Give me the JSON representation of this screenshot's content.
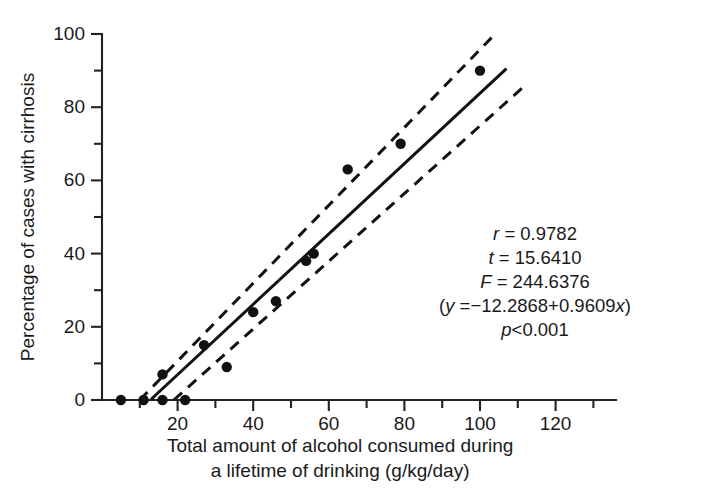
{
  "chart_data": {
    "type": "scatter",
    "title": "",
    "xlabel": "Total amount of alcohol consumed during a lifetime of drinking (g/kg/day)",
    "xlabel_line1": "Total amount of alcohol consumed during",
    "xlabel_line2": "a lifetime of drinking (g/kg/day)",
    "ylabel": "Percentage of cases with cirrhosis",
    "xlim": [
      0,
      136
    ],
    "ylim": [
      0,
      100
    ],
    "xticks": [
      20,
      40,
      60,
      80,
      100,
      120
    ],
    "xticklabels": [
      "20",
      "40",
      "60",
      "80",
      "100",
      "120"
    ],
    "xminorticks": [
      10,
      30,
      50,
      70,
      90,
      110,
      130
    ],
    "yticks": [
      0,
      20,
      40,
      60,
      80,
      100
    ],
    "yticklabels": [
      "0",
      "20",
      "40",
      "60",
      "80",
      "100"
    ],
    "yminorticks": [
      10,
      30,
      50,
      70,
      90
    ],
    "grid": false,
    "legend": "none",
    "points": [
      {
        "x": 5,
        "y": 0
      },
      {
        "x": 11,
        "y": 0
      },
      {
        "x": 16,
        "y": 0
      },
      {
        "x": 16,
        "y": 7
      },
      {
        "x": 22,
        "y": 0
      },
      {
        "x": 27,
        "y": 15
      },
      {
        "x": 33,
        "y": 9
      },
      {
        "x": 40,
        "y": 24
      },
      {
        "x": 46,
        "y": 27
      },
      {
        "x": 54,
        "y": 38
      },
      {
        "x": 56,
        "y": 40
      },
      {
        "x": 65,
        "y": 63
      },
      {
        "x": 79,
        "y": 70
      },
      {
        "x": 100,
        "y": 90
      }
    ],
    "fit_line": {
      "label": "regression line",
      "intercept": -12.2868,
      "slope": 0.9609,
      "x_start": 13,
      "x_end": 107
    },
    "confidence_bands": [
      {
        "label": "upper confidence band",
        "x_start": 10,
        "y_start": 0,
        "x_end": 104,
        "y_end": 100
      },
      {
        "label": "lower confidence band",
        "x_start": 19,
        "y_start": 0,
        "x_end": 112,
        "y_end": 86
      }
    ],
    "annotations": {
      "r_label": "r",
      "r_value": "= 0.9782",
      "t_label": "t",
      "t_value": "= 15.6410",
      "F_label": "F",
      "F_value": "= 244.6376",
      "eq_open": "(",
      "eq_y": "y",
      "eq_body": " =−12.2868+0.9609",
      "eq_x": "x",
      "eq_close": ")",
      "p_label": "p",
      "p_value": "<0.001"
    },
    "colors": {
      "axis": "#222222",
      "point": "#111111",
      "fit": "#111111",
      "band": "#111111",
      "background": "#ffffff"
    }
  }
}
